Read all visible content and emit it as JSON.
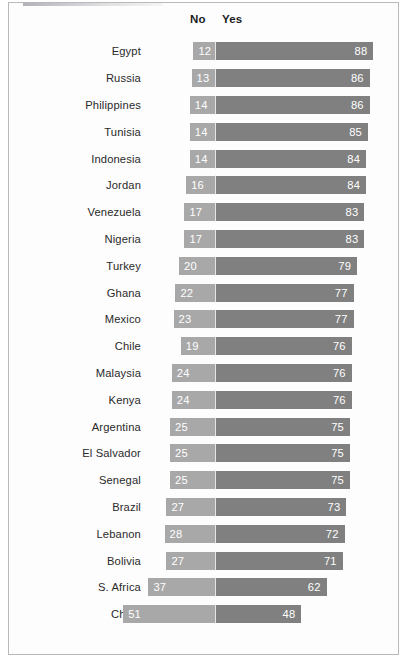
{
  "chart_data": {
    "type": "bar",
    "subtype": "diverging-stacked-bar",
    "title": "",
    "xlabel": "",
    "ylabel": "",
    "legend_position": "top",
    "grid": false,
    "axis_origin_value": 0,
    "note": "Horizontal diverging bars: 'No' segment extends left of a fixed center divider, 'Yes' segment extends right. Values are percentages.",
    "series": [
      {
        "name": "No",
        "color": "#a8a8a8",
        "direction": "left"
      },
      {
        "name": "Yes",
        "color": "#808080",
        "direction": "right"
      }
    ],
    "categories": [
      "Egypt",
      "Russia",
      "Philippines",
      "Tunisia",
      "Indonesia",
      "Jordan",
      "Venezuela",
      "Nigeria",
      "Turkey",
      "Ghana",
      "Mexico",
      "Chile",
      "Malaysia",
      "Kenya",
      "Argentina",
      "El Salvador",
      "Senegal",
      "Brazil",
      "Lebanon",
      "Bolivia",
      "S. Africa",
      "China"
    ],
    "no_values": [
      12,
      13,
      14,
      14,
      14,
      16,
      17,
      17,
      20,
      22,
      23,
      19,
      24,
      24,
      25,
      25,
      25,
      27,
      28,
      27,
      37,
      51
    ],
    "yes_values": [
      88,
      86,
      86,
      85,
      84,
      84,
      83,
      83,
      79,
      77,
      77,
      76,
      76,
      76,
      75,
      75,
      75,
      73,
      72,
      71,
      62,
      48
    ],
    "rows": [
      {
        "category": "Egypt",
        "no": 12,
        "yes": 88
      },
      {
        "category": "Russia",
        "no": 13,
        "yes": 86
      },
      {
        "category": "Philippines",
        "no": 14,
        "yes": 86
      },
      {
        "category": "Tunisia",
        "no": 14,
        "yes": 85
      },
      {
        "category": "Indonesia",
        "no": 14,
        "yes": 84
      },
      {
        "category": "Jordan",
        "no": 16,
        "yes": 84
      },
      {
        "category": "Venezuela",
        "no": 17,
        "yes": 83
      },
      {
        "category": "Nigeria",
        "no": 17,
        "yes": 83
      },
      {
        "category": "Turkey",
        "no": 20,
        "yes": 79
      },
      {
        "category": "Ghana",
        "no": 22,
        "yes": 77
      },
      {
        "category": "Mexico",
        "no": 23,
        "yes": 77
      },
      {
        "category": "Chile",
        "no": 19,
        "yes": 76
      },
      {
        "category": "Malaysia",
        "no": 24,
        "yes": 76
      },
      {
        "category": "Kenya",
        "no": 24,
        "yes": 76
      },
      {
        "category": "Argentina",
        "no": 25,
        "yes": 75
      },
      {
        "category": "El Salvador",
        "no": 25,
        "yes": 75
      },
      {
        "category": "Senegal",
        "no": 25,
        "yes": 75
      },
      {
        "category": "Brazil",
        "no": 27,
        "yes": 73
      },
      {
        "category": "Lebanon",
        "no": 28,
        "yes": 72
      },
      {
        "category": "Bolivia",
        "no": 27,
        "yes": 71
      },
      {
        "category": "S. Africa",
        "no": 37,
        "yes": 62
      },
      {
        "category": "China",
        "no": 51,
        "yes": 48
      }
    ]
  },
  "legend": {
    "no_label": "No",
    "yes_label": "Yes"
  },
  "colors": {
    "no_bar": "#a8a8a8",
    "yes_bar": "#808080",
    "value_text": "#ffffff",
    "label_text": "#2a2a2a",
    "frame_border": "#b9b9b9",
    "background": "#fdfdfd"
  },
  "layout": {
    "divider_x_px": 206,
    "px_per_unit": 1.8,
    "bar_height_px": 18,
    "row_pitch_px": 26.8
  }
}
